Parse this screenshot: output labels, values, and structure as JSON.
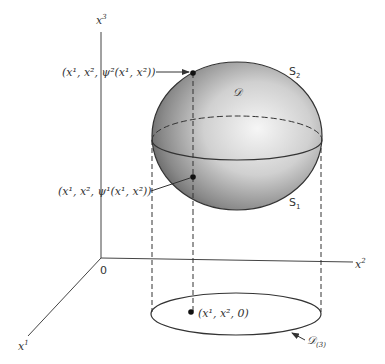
{
  "figure": {
    "axes": {
      "x1": {
        "base": "x",
        "sup": "1"
      },
      "x2": {
        "base": "x",
        "sup": "2"
      },
      "x3": {
        "base": "x",
        "sup": "3"
      },
      "origin": "0"
    },
    "labels": {
      "top_point": {
        "text": "(x¹, x², ψ²(x¹, x²))"
      },
      "bottom_point": {
        "text": "(x¹, x², ψ¹(x¹, x²))"
      },
      "base_point": {
        "text": "(x¹, x², 0)"
      },
      "region": "𝒟",
      "upper_surface": {
        "base": "S",
        "sub": "2"
      },
      "lower_surface": {
        "base": "S",
        "sub": "1"
      },
      "projection": {
        "base": "𝒟",
        "sub": "(3)"
      }
    },
    "colors": {
      "line": "#333333",
      "shade_light": "#f4f4f4",
      "shade_dark": "#555555"
    }
  }
}
